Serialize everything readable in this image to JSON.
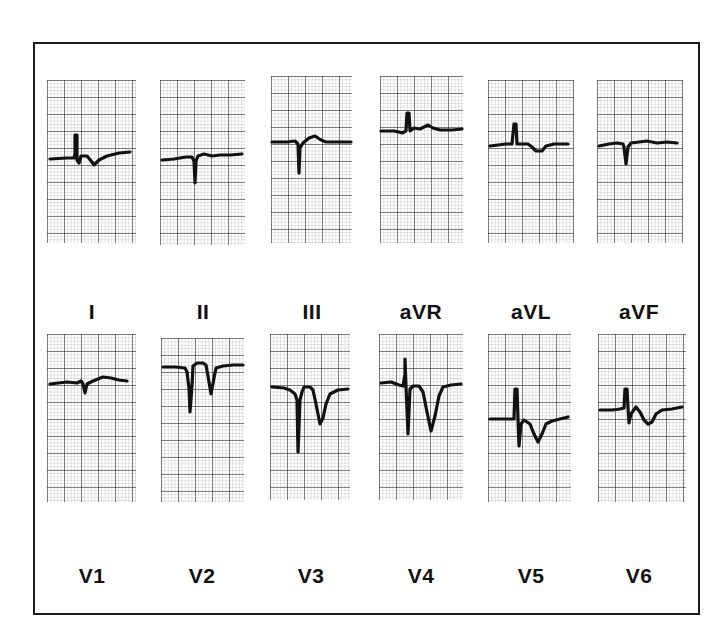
{
  "figure": {
    "border_color": "#1a1a1a",
    "trace_color": "#111111",
    "grid": {
      "major_px": 17,
      "minor_px": 3.4
    }
  },
  "limb_leads": [
    {
      "label": "I"
    },
    {
      "label": "II"
    },
    {
      "label": "III"
    },
    {
      "label": "aVR"
    },
    {
      "label": "aVL"
    },
    {
      "label": "aVF"
    }
  ],
  "precordial_leads": [
    {
      "label": "V1"
    },
    {
      "label": "V2"
    },
    {
      "label": "V3"
    },
    {
      "label": "V4"
    },
    {
      "label": "V5"
    },
    {
      "label": "V6"
    }
  ]
}
